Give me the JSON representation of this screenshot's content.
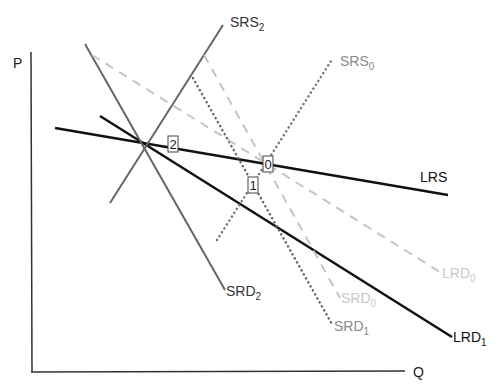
{
  "diagram": {
    "title": "",
    "axes": {
      "y_label": "P",
      "x_label": "Q"
    },
    "curves": [
      {
        "id": "LRS",
        "label": "LRS",
        "sub": "",
        "style": "solid",
        "color": "#111111",
        "width": 2.5,
        "x1": 55,
        "y1": 128,
        "x2": 448,
        "y2": 195,
        "lx": 420,
        "ly": 182
      },
      {
        "id": "LRD1",
        "label": "LRD",
        "sub": "1",
        "style": "solid",
        "color": "#111111",
        "width": 2.5,
        "x1": 100,
        "y1": 116,
        "x2": 452,
        "y2": 337,
        "lx": 453,
        "ly": 342
      },
      {
        "id": "SRS2",
        "label": "SRS",
        "sub": "2",
        "style": "solid",
        "color": "#666666",
        "width": 2,
        "x1": 110,
        "y1": 203,
        "x2": 223,
        "y2": 25,
        "lx": 230,
        "ly": 27
      },
      {
        "id": "SRD2",
        "label": "SRD",
        "sub": "2",
        "style": "solid",
        "color": "#666666",
        "width": 2,
        "x1": 85,
        "y1": 44,
        "x2": 225,
        "y2": 290,
        "lx": 226,
        "ly": 296
      },
      {
        "id": "SRS0",
        "label": "SRS",
        "sub": "0",
        "style": "dotted",
        "color": "#777777",
        "width": 2.5,
        "x1": 217,
        "y1": 240,
        "x2": 331,
        "y2": 61,
        "lx": 340,
        "ly": 66
      },
      {
        "id": "SRD1",
        "label": "SRD",
        "sub": "1",
        "style": "dotted",
        "color": "#666666",
        "width": 2.5,
        "x1": 193,
        "y1": 78,
        "x2": 333,
        "y2": 326,
        "lx": 334,
        "ly": 331
      },
      {
        "id": "SRD0",
        "label": "SRD",
        "sub": "0",
        "style": "dashed",
        "color": "#c4c4c4",
        "width": 2,
        "x1": 204,
        "y1": 55,
        "x2": 340,
        "y2": 298,
        "lx": 341,
        "ly": 303
      },
      {
        "id": "LRD0",
        "label": "LRD",
        "sub": "0",
        "style": "dashed",
        "color": "#c4c4c4",
        "width": 2,
        "x1": 92,
        "y1": 55,
        "x2": 440,
        "y2": 272,
        "lx": 442,
        "ly": 278
      }
    ],
    "points": [
      {
        "id": "point-2",
        "label": "2",
        "x": 173,
        "y": 144
      },
      {
        "id": "point-0",
        "label": "0",
        "x": 268,
        "y": 164
      },
      {
        "id": "point-1",
        "label": "1",
        "x": 253,
        "y": 185
      }
    ]
  }
}
